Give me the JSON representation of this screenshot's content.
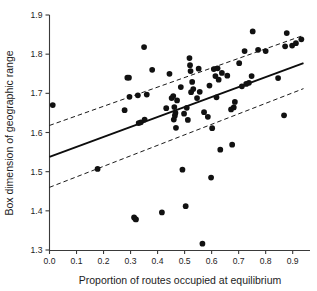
{
  "chart_data": {
    "type": "scatter",
    "title": "",
    "xlabel": "Proportion of routes occupied at equilibrium",
    "ylabel": "Box dimension of geographic range",
    "xlim": [
      -0.01,
      0.95
    ],
    "ylim": [
      1.3,
      1.9
    ],
    "xticks": [
      0.0,
      0.1,
      0.2,
      0.3,
      0.4,
      0.5,
      0.6,
      0.7,
      0.8,
      0.9
    ],
    "xtick_labels": [
      "0.0",
      "0.1",
      "0.2",
      "0.3",
      "0.4",
      "0.5",
      "0.6",
      "0.7",
      "0.8",
      "0.9"
    ],
    "yticks": [
      1.3,
      1.4,
      1.5,
      1.6,
      1.7,
      1.8,
      1.9
    ],
    "ytick_labels": [
      "1.3",
      "1.4",
      "1.5",
      "1.6",
      "1.7",
      "1.8",
      "1.9"
    ],
    "grid": false,
    "legend": null,
    "marker": {
      "shape": "circle",
      "color": "#111111",
      "size": 4.6
    },
    "points": [
      [
        0.012,
        1.67
      ],
      [
        0.178,
        1.507
      ],
      [
        0.278,
        1.657
      ],
      [
        0.288,
        1.74
      ],
      [
        0.294,
        1.74
      ],
      [
        0.296,
        1.691
      ],
      [
        0.313,
        1.383
      ],
      [
        0.318,
        1.379
      ],
      [
        0.32,
        1.378
      ],
      [
        0.327,
        1.695
      ],
      [
        0.33,
        1.624
      ],
      [
        0.338,
        1.626
      ],
      [
        0.35,
        1.818
      ],
      [
        0.352,
        1.633
      ],
      [
        0.36,
        1.697
      ],
      [
        0.38,
        1.76
      ],
      [
        0.416,
        1.396
      ],
      [
        0.432,
        1.662
      ],
      [
        0.444,
        1.75
      ],
      [
        0.452,
        1.688
      ],
      [
        0.458,
        1.693
      ],
      [
        0.46,
        1.633
      ],
      [
        0.462,
        1.665
      ],
      [
        0.464,
        1.643
      ],
      [
        0.466,
        1.65
      ],
      [
        0.468,
        1.612
      ],
      [
        0.472,
        1.682
      ],
      [
        0.486,
        1.716
      ],
      [
        0.492,
        1.505
      ],
      [
        0.498,
        1.648
      ],
      [
        0.504,
        1.412
      ],
      [
        0.508,
        1.663
      ],
      [
        0.512,
        1.632
      ],
      [
        0.518,
        1.79
      ],
      [
        0.52,
        1.772
      ],
      [
        0.522,
        1.757
      ],
      [
        0.524,
        1.703
      ],
      [
        0.528,
        1.729
      ],
      [
        0.532,
        1.711
      ],
      [
        0.546,
        1.688
      ],
      [
        0.552,
        1.763
      ],
      [
        0.556,
        1.704
      ],
      [
        0.566,
        1.316
      ],
      [
        0.572,
        1.652
      ],
      [
        0.586,
        1.64
      ],
      [
        0.592,
        1.72
      ],
      [
        0.598,
        1.485
      ],
      [
        0.602,
        1.611
      ],
      [
        0.608,
        1.762
      ],
      [
        0.614,
        1.744
      ],
      [
        0.618,
        1.69
      ],
      [
        0.622,
        1.764
      ],
      [
        0.626,
        1.735
      ],
      [
        0.632,
        1.556
      ],
      [
        0.638,
        1.752
      ],
      [
        0.658,
        1.745
      ],
      [
        0.672,
        1.659
      ],
      [
        0.676,
        1.569
      ],
      [
        0.682,
        1.664
      ],
      [
        0.686,
        1.678
      ],
      [
        0.702,
        1.777
      ],
      [
        0.712,
        1.718
      ],
      [
        0.722,
        1.808
      ],
      [
        0.728,
        1.724
      ],
      [
        0.738,
        1.727
      ],
      [
        0.748,
        1.744
      ],
      [
        0.752,
        1.858
      ],
      [
        0.772,
        1.811
      ],
      [
        0.8,
        1.808
      ],
      [
        0.846,
        1.739
      ],
      [
        0.868,
        1.644
      ],
      [
        0.872,
        1.82
      ],
      [
        0.878,
        1.854
      ],
      [
        0.898,
        1.822
      ],
      [
        0.912,
        1.828
      ],
      [
        0.932,
        1.838
      ]
    ],
    "fit_line": {
      "label": "regression",
      "style": "solid",
      "x": [
        0.0,
        0.94
      ],
      "y": [
        1.538,
        1.777
      ]
    },
    "confidence_bands": [
      {
        "label": "upper-confidence-band",
        "style": "dashed",
        "x": [
          0.0,
          0.94
        ],
        "y": [
          1.618,
          1.848
        ]
      },
      {
        "label": "lower-confidence-band",
        "style": "dashed",
        "x": [
          0.0,
          0.94
        ],
        "y": [
          1.46,
          1.712
        ]
      }
    ]
  }
}
